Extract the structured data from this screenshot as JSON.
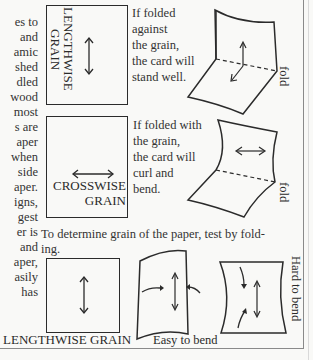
{
  "left_column": {
    "lines": [
      "es to",
      "and",
      "amic",
      "shed",
      "dled",
      "wood",
      "most",
      "s are",
      "aper",
      "when",
      "side",
      "aper.",
      "igns,",
      "gest",
      "er is",
      "and",
      "aper,",
      "asily",
      "has"
    ]
  },
  "figure_lengthwise": {
    "label": "LENGTHWISE GRAIN",
    "label_line1": "LENGTHWISE",
    "label_line2": "GRAIN",
    "caption_lines": [
      "If folded",
      "against",
      "the grain,",
      "the card will",
      "stand  well."
    ],
    "fold_label": "fold"
  },
  "figure_crosswise": {
    "label_line1": "CROSSWISE",
    "label_line2": "GRAIN",
    "caption_lines": [
      "If folded with",
      "the grain,",
      "the card will",
      "curl and",
      "bend."
    ],
    "fold_label": "fold"
  },
  "instruction": {
    "line1": "To determine grain of the paper, test by fold-",
    "line2": "ing."
  },
  "bottom_row": {
    "label_lengthwise": "LENGTHWISE GRAIN",
    "label_easy": "Easy to bend",
    "label_hard": "Hard to bend"
  },
  "colors": {
    "ink": "#2b2b2b",
    "paper": "#f9f9f7",
    "frame": "#8a8a8a"
  }
}
